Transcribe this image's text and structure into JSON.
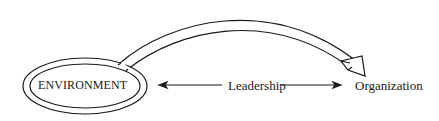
{
  "diagram": {
    "nodes": [
      {
        "id": "environment",
        "label": "ENVIRONMENT",
        "shape": "double-ellipse"
      },
      {
        "id": "organization",
        "label": "Organization",
        "shape": "none"
      }
    ],
    "edges": [
      {
        "from": "environment",
        "to": "organization",
        "label": "Leadership",
        "style": "bidirectional-line"
      },
      {
        "from": "environment",
        "to": "organization",
        "label": "",
        "style": "curved-hollow-arrow"
      }
    ]
  },
  "labels": {
    "environment": "ENVIRONMENT",
    "leadership": "Leadership",
    "organization": "Organization"
  },
  "colors": {
    "stroke": "#1a1a1a",
    "background": "#ffffff"
  }
}
